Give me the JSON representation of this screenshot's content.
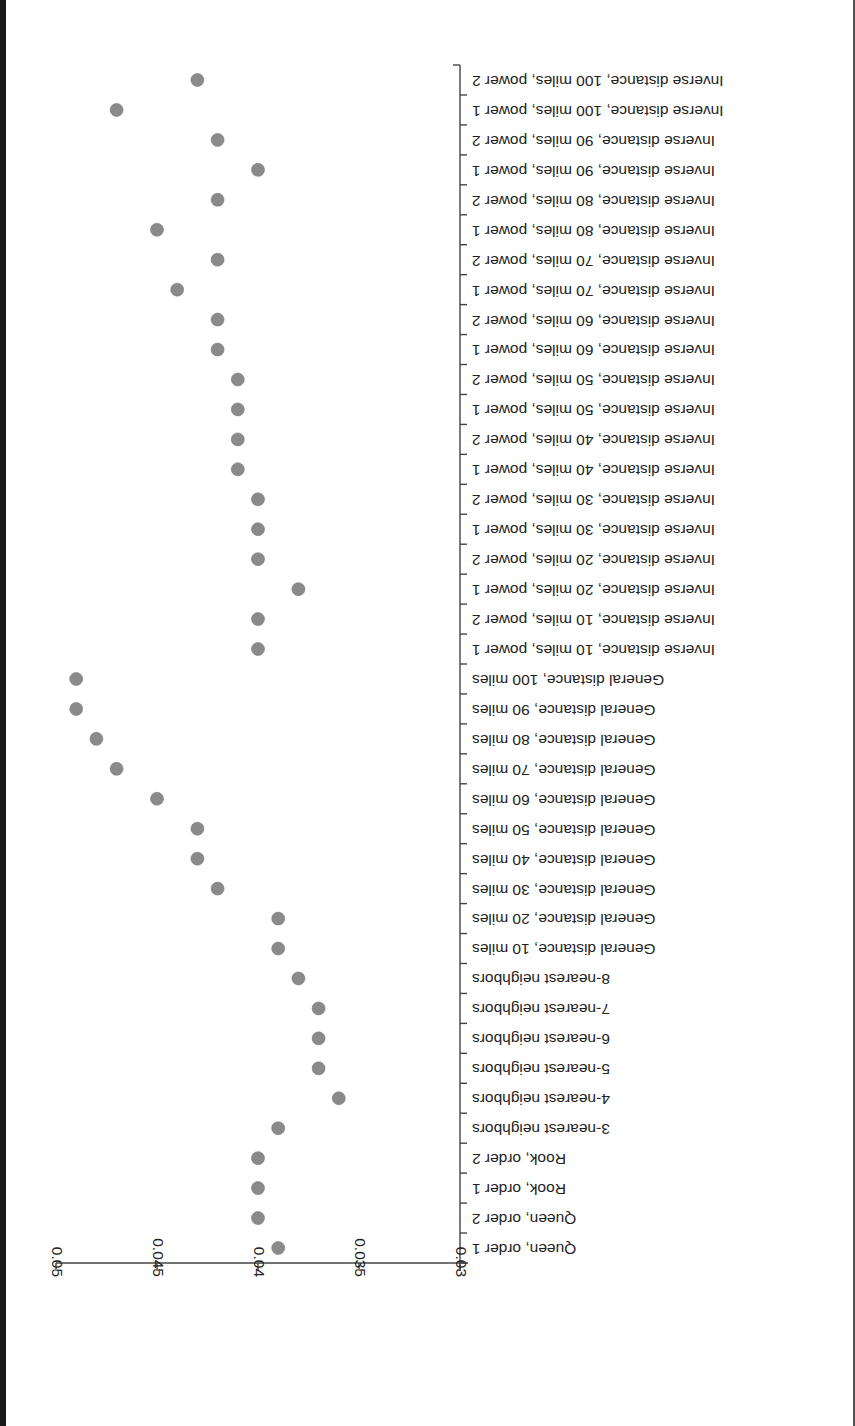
{
  "chart_data": {
    "type": "scatter",
    "orientation": "image rotated 180 degrees (category labels read upside down)",
    "title": "",
    "xlabel": "",
    "ylabel": "",
    "value_axis": {
      "range": [
        0.03,
        0.05
      ],
      "ticks": [
        0.03,
        0.035,
        0.04,
        0.045,
        0.05
      ],
      "tick_labels": [
        "0.03",
        "0.035",
        "0.04",
        "0.045",
        "0.05"
      ]
    },
    "grid": false,
    "legend": null,
    "marker_color": "#8a8a8a",
    "categories": [
      "Queen, order 1",
      "Queen, order 2",
      "Rook, order 1",
      "Rook, order 2",
      "3-nearest neighbors",
      "4-nearest neighbors",
      "5-nearest neighbors",
      "6-nearest neighbors",
      "7-nearest neighbors",
      "8-nearest neighbors",
      "General distance, 10 miles",
      "General distance, 20 miles",
      "General distance, 30 miles",
      "General distance, 40 miles",
      "General distance, 50 miles",
      "General distance, 60 miles",
      "General distance, 70 miles",
      "General distance, 80 miles",
      "General distance, 90 miles",
      "General distance, 100 miles",
      "Inverse distance, 10 miles, power 1",
      "Inverse distance, 10 miles, power 2",
      "Inverse distance, 20 miles, power 1",
      "Inverse distance, 20 miles, power 2",
      "Inverse distance, 30 miles, power 1",
      "Inverse distance, 30 miles, power 2",
      "Inverse distance, 40 miles, power 1",
      "Inverse distance, 40 miles, power 2",
      "Inverse distance, 50 miles, power 1",
      "Inverse distance, 50 miles, power 2",
      "Inverse distance, 60 miles, power 1",
      "Inverse distance, 60 miles, power 2",
      "Inverse distance, 70 miles, power 1",
      "Inverse distance, 70 miles, power 2",
      "Inverse distance, 80 miles, power 1",
      "Inverse distance, 80 miles, power 2",
      "Inverse distance, 90 miles, power 1",
      "Inverse distance, 90 miles, power 2",
      "Inverse distance, 100 miles, power 1",
      "Inverse distance, 100 miles, power 2"
    ],
    "values": [
      0.039,
      0.04,
      0.04,
      0.04,
      0.039,
      0.036,
      0.037,
      0.037,
      0.037,
      0.038,
      0.039,
      0.039,
      0.042,
      0.043,
      0.043,
      0.045,
      0.047,
      0.048,
      0.049,
      0.049,
      0.04,
      0.04,
      0.038,
      0.04,
      0.04,
      0.04,
      0.041,
      0.041,
      0.041,
      0.041,
      0.042,
      0.042,
      0.044,
      0.042,
      0.045,
      0.042,
      0.04,
      0.042,
      0.047,
      0.043
    ]
  }
}
